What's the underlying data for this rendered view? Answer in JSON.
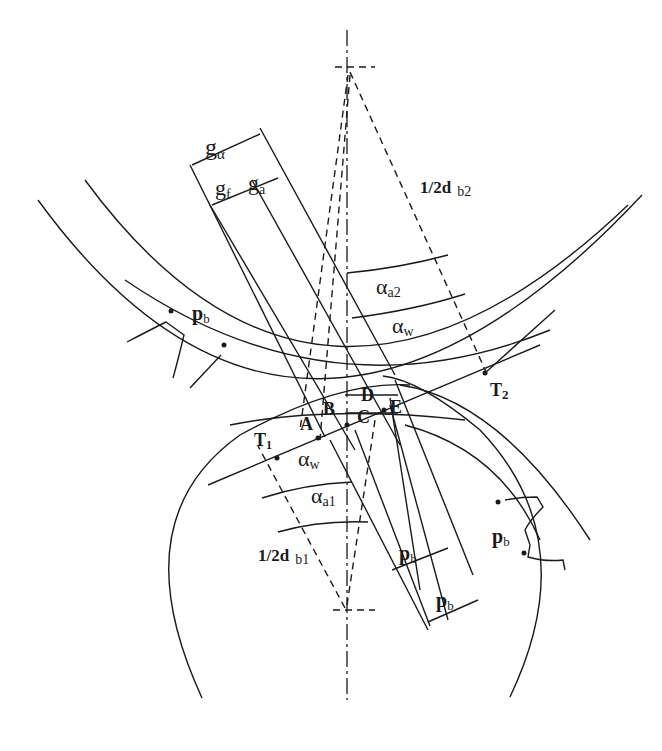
{
  "diagram": {
    "type": "involute gear mesh - contact ratio construction",
    "labels": {
      "g_alpha": {
        "main": "g",
        "sub": "α"
      },
      "g_f": {
        "main": "g",
        "sub": "f"
      },
      "g_a": {
        "main": "g",
        "sub": "a"
      },
      "half_db2": {
        "main": "1/2d",
        "sub": "b2"
      },
      "half_db1": {
        "main": "1/2d",
        "sub": "b1"
      },
      "alpha_a2": {
        "main": "α",
        "sub": "a2"
      },
      "alpha_w_top": {
        "main": "α",
        "sub": "w"
      },
      "alpha_w_bottom": {
        "main": "α",
        "sub": "w"
      },
      "alpha_a1": {
        "main": "α",
        "sub": "a1"
      },
      "T1": {
        "main": "T",
        "sub": "1"
      },
      "T2": {
        "main": "T",
        "sub": "2"
      },
      "A": "A",
      "B": "B",
      "C": "C",
      "D": "D",
      "E": "E",
      "pb_gear2": {
        "main": "p",
        "sub": "b"
      },
      "pb_gear1": {
        "main": "p",
        "sub": "b"
      },
      "pb_dim1": {
        "main": "p",
        "sub": "b"
      },
      "pb_dim2": {
        "main": "p",
        "sub": "b"
      }
    },
    "points": [
      "T1",
      "A",
      "B",
      "C",
      "D",
      "E",
      "T2"
    ],
    "elements": [
      "gear-1 base circle",
      "gear-1 tip circle",
      "gear-2 base circle",
      "gear-2 tip circle",
      "line of action T1-T2",
      "centre line",
      "base pitch dimensions"
    ]
  }
}
